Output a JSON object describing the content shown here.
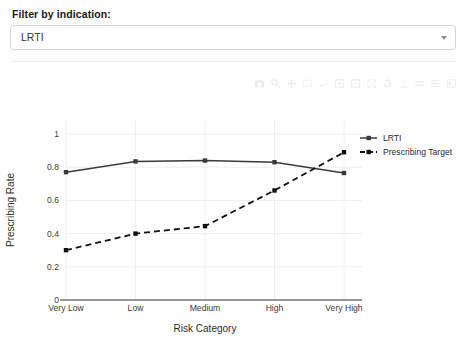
{
  "filter": {
    "label": "Filter by indication:",
    "selected_value": "LRTI",
    "caret_icon": "chevron-down-icon"
  },
  "modebar": {
    "buttons": [
      {
        "name": "camera-icon",
        "title": "Download plot as a png"
      },
      {
        "name": "zoom-icon",
        "title": "Zoom"
      },
      {
        "name": "pan-icon",
        "title": "Pan"
      },
      {
        "name": "zoom-box-select-icon",
        "title": "Box Select"
      },
      {
        "name": "lasso-select-icon",
        "title": "Lasso Select"
      },
      {
        "name": "zoom-in-icon",
        "title": "Zoom in"
      },
      {
        "name": "zoom-out-icon",
        "title": "Zoom out"
      },
      {
        "name": "autoscale-icon",
        "title": "Autoscale"
      },
      {
        "name": "reset-axes-icon",
        "title": "Reset axes"
      },
      {
        "name": "spike-lines-icon",
        "title": "Toggle Spike Lines"
      },
      {
        "name": "hover-compare-icon",
        "title": "Compare data on hover"
      },
      {
        "name": "hover-closest-icon",
        "title": "Show closest data on hover"
      },
      {
        "name": "plotly-logo-icon",
        "title": "Produced with Plotly"
      }
    ]
  },
  "chart_data": {
    "type": "line",
    "title": "",
    "xlabel": "Risk Category",
    "ylabel": "Prescribing Rate",
    "categories": [
      "Very Low",
      "Low",
      "Medium",
      "High",
      "Very High"
    ],
    "yticks": [
      "0",
      "0.2",
      "0.4",
      "0.6",
      "0.8",
      "1"
    ],
    "ytick_values": [
      0,
      0.2,
      0.4,
      0.6,
      0.8,
      1
    ],
    "ylim": [
      0,
      1.05
    ],
    "grid": true,
    "legend_position": "right",
    "series": [
      {
        "name": "LRTI",
        "style": "solid",
        "color": "#3a3a3a",
        "marker": "square",
        "values": [
          0.77,
          0.835,
          0.84,
          0.83,
          0.765
        ]
      },
      {
        "name": "Prescribing Target",
        "style": "dashed",
        "color": "#111111",
        "marker": "square",
        "values": [
          0.3,
          0.4,
          0.445,
          0.66,
          0.89
        ]
      }
    ]
  }
}
